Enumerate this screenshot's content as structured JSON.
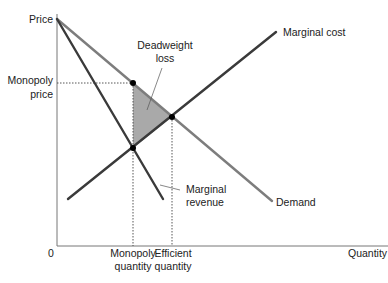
{
  "diagram": {
    "type": "monopoly-deadweight-loss",
    "axes": {
      "y_label": "Price",
      "x_label": "Quantity",
      "origin_label": "0"
    },
    "curves": [
      {
        "name": "Marginal cost",
        "color": "#3a3a3a"
      },
      {
        "name": "Demand",
        "color": "#7a7a7a"
      },
      {
        "name": "Marginal revenue",
        "color": "#3a3a3a"
      }
    ],
    "labels": {
      "marginal_cost": "Marginal cost",
      "demand": "Demand",
      "marginal_revenue_line1": "Marginal",
      "marginal_revenue_line2": "revenue",
      "deadweight_line1": "Deadweight",
      "deadweight_line2": "loss",
      "monopoly_price_line1": "Monopoly",
      "monopoly_price_line2": "price",
      "monopoly_quantity_line1": "Monopoly",
      "monopoly_quantity_line2": "quantity",
      "efficient_quantity_line1": "Efficient",
      "efficient_quantity_line2": "quantity"
    },
    "colors": {
      "deadweight_fill": "#a8a8a8",
      "axis": "#666666",
      "point": "#000000"
    }
  }
}
